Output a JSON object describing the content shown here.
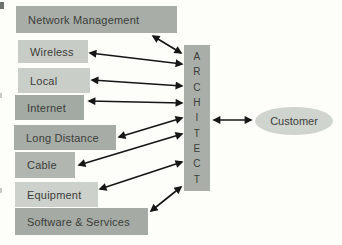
{
  "diagram": {
    "background": "#fdfdfa",
    "arrow_color": "#161616",
    "text_color": "#3b3d3a",
    "nodes": [
      {
        "id": "network-management",
        "label": "Network Management",
        "color": "#a8aea7"
      },
      {
        "id": "wireless",
        "label": "Wireless",
        "color": "#c8ccc6"
      },
      {
        "id": "local",
        "label": "Local",
        "color": "#cacec8"
      },
      {
        "id": "internet",
        "label": "Internet",
        "color": "#a3aaa3"
      },
      {
        "id": "long-distance",
        "label": "Long Distance",
        "color": "#a7ada6"
      },
      {
        "id": "cable",
        "label": "Cable",
        "color": "#b1b6b0"
      },
      {
        "id": "equipment",
        "label": "Equipment",
        "color": "#cdd1cb"
      },
      {
        "id": "software-services",
        "label": "Software & Services",
        "color": "#a5aba4"
      }
    ],
    "hub": {
      "id": "architect",
      "label": "ARCHITECT",
      "label_stacked": "A\nR\nC\nH\nI\nT\nE\nC\nT",
      "color": "#a9afa8"
    },
    "customer": {
      "id": "customer",
      "label": "Customer",
      "color": "#d0d4cf"
    },
    "edges": [
      {
        "from": "network-management",
        "to": "architect",
        "bidirectional": true
      },
      {
        "from": "wireless",
        "to": "architect",
        "bidirectional": true
      },
      {
        "from": "local",
        "to": "architect",
        "bidirectional": true
      },
      {
        "from": "internet",
        "to": "architect",
        "bidirectional": true
      },
      {
        "from": "long-distance",
        "to": "architect",
        "bidirectional": true
      },
      {
        "from": "cable",
        "to": "architect",
        "bidirectional": true
      },
      {
        "from": "equipment",
        "to": "architect",
        "bidirectional": true
      },
      {
        "from": "software-services",
        "to": "architect",
        "bidirectional": true
      },
      {
        "from": "architect",
        "to": "customer",
        "bidirectional": true
      }
    ]
  }
}
